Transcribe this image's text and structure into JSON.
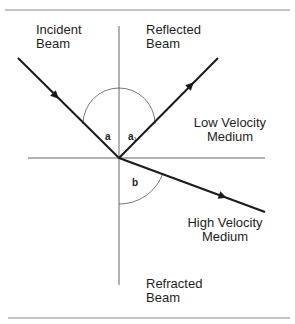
{
  "diagram": {
    "labels": {
      "incident": [
        "Incident",
        "Beam"
      ],
      "reflected": [
        "Reflected",
        "Beam"
      ],
      "low_medium": [
        "Low Velocity",
        "Medium"
      ],
      "high_medium": [
        "High Velocity",
        "Medium"
      ],
      "refracted": [
        "Refracted",
        "Beam"
      ]
    },
    "angles": {
      "incidence": "a",
      "reflection": "a",
      "reflection_sub": "1",
      "refraction": "b"
    },
    "colors": {
      "line": "#1a1a1a",
      "rule": "#8a8a8a",
      "text": "#1e1e1e",
      "background": "#ffffff"
    }
  }
}
